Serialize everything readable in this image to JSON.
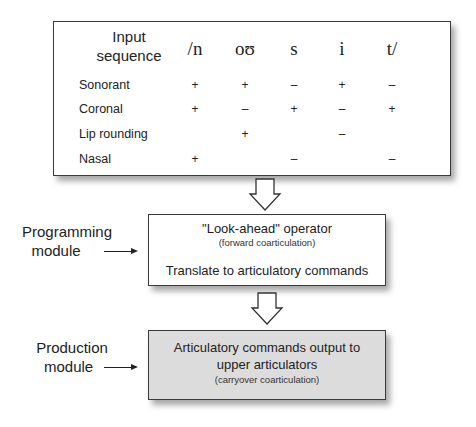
{
  "table": {
    "header_label": "Input\nsequence",
    "header_line1": "Input",
    "header_line2": "sequence",
    "segments": [
      "/n",
      "oʊ",
      "s",
      "i",
      "t/"
    ],
    "rows": [
      {
        "label": "Sonorant",
        "values": [
          "+",
          "+",
          "–",
          "+",
          "–"
        ]
      },
      {
        "label": "Coronal",
        "values": [
          "+",
          "–",
          "+",
          "–",
          "+"
        ]
      },
      {
        "label": "Lip rounding",
        "values": [
          "",
          "+",
          "",
          "–",
          ""
        ]
      },
      {
        "label": "Nasal",
        "values": [
          "+",
          "",
          "–",
          "",
          "–"
        ]
      }
    ]
  },
  "programming_module": {
    "side_line1": "Programming",
    "side_line2": "module",
    "title": "\"Look-ahead\" operator",
    "subtitle": "(forward coarticulation)",
    "line3": "Translate to articulatory commands"
  },
  "production_module": {
    "side_line1": "Production",
    "side_line2": "module",
    "line1": "Articulatory commands output to",
    "line2": "upper articulators",
    "subtitle": "(carryover coarticulation)",
    "fill_color": "#dcdcdc"
  }
}
